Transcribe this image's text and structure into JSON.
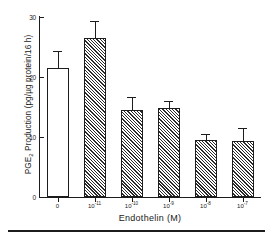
{
  "chart_data": {
    "type": "bar",
    "title": "",
    "xlabel": "Endothelin (M)",
    "ylabel": "PGE2 Production (pg/µg protein/16 h)",
    "ylabel_parts": {
      "prefix": "PGE",
      "subscript": "2",
      "suffix": " Production (pg/µg protein/16 h)"
    },
    "categories": [
      "0",
      "10-11",
      "10-10",
      "10-9",
      "10-8",
      "10-7"
    ],
    "category_labels": [
      {
        "base": "0",
        "exp": ""
      },
      {
        "base": "10",
        "exp": "-11"
      },
      {
        "base": "10",
        "exp": "-10"
      },
      {
        "base": "10",
        "exp": "-9"
      },
      {
        "base": "10",
        "exp": "-8"
      },
      {
        "base": "10",
        "exp": "-7"
      }
    ],
    "values": [
      21.5,
      26.5,
      14.5,
      14.8,
      9.5,
      9.3
    ],
    "errors": [
      2.9,
      2.8,
      2.2,
      1.2,
      1.0,
      2.2
    ],
    "bar_styles": [
      "open",
      "hatched",
      "hatched",
      "hatched",
      "hatched",
      "hatched"
    ],
    "ylim": [
      0,
      30
    ],
    "yticks": [
      0,
      10,
      20,
      30
    ],
    "ytick_labels": [
      "0",
      "10",
      "20",
      "30"
    ],
    "grid": false,
    "legend": null,
    "error_bar_type": "upper-only",
    "colors": {
      "axis": "#1c1c1c",
      "bar_edge": "#1c1c1c",
      "bar_fill_open": "#ffffff",
      "hatch": "#2a2a2a",
      "background": "#ffffff"
    }
  }
}
